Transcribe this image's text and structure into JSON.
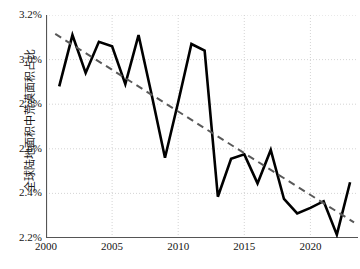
{
  "chart_data": {
    "type": "line",
    "title": "",
    "subtitle": "",
    "xlabel": "",
    "ylabel": "全球陆地面积中荒漠面积占比",
    "xlim": [
      2000,
      2023.6
    ],
    "ylim": [
      2.2,
      3.2
    ],
    "xticks": [
      2000,
      2005,
      2010,
      2015,
      2020
    ],
    "xticklabels": [
      "2000",
      "2005",
      "2010",
      "2015",
      "2020"
    ],
    "yticks": [
      2.2,
      2.4,
      2.6,
      2.8,
      3.0,
      3.2
    ],
    "yticklabels": [
      "2.2%",
      "2.4%",
      "2.6%",
      "2.8%",
      "3.0%",
      "3.2%"
    ],
    "grid": true,
    "grid_style": "dotted",
    "legend": "none",
    "series": [
      {
        "name": "全球陆地面积中荒漠面积占比",
        "kind": "line",
        "color": "#000000",
        "linewidth": 2.6,
        "x": [
          2001,
          2002,
          2003,
          2004,
          2005,
          2006,
          2007,
          2008,
          2009,
          2010,
          2011,
          2012,
          2013,
          2014,
          2015,
          2016,
          2017,
          2018,
          2019,
          2020,
          2021,
          2022,
          2023
        ],
        "values": [
          2.88,
          3.11,
          2.94,
          3.08,
          3.06,
          2.89,
          3.11,
          2.84,
          2.56,
          2.81,
          3.07,
          3.04,
          2.385,
          2.555,
          2.575,
          2.445,
          2.595,
          2.375,
          2.31,
          2.335,
          2.365,
          2.215,
          2.45
        ]
      },
      {
        "name": "线性趋势线",
        "kind": "trendline",
        "color": "#595959",
        "linewidth": 2.0,
        "dash": "7,5",
        "x": [
          2000.7,
          2023.3
        ],
        "values": [
          3.115,
          2.27
        ]
      }
    ]
  }
}
